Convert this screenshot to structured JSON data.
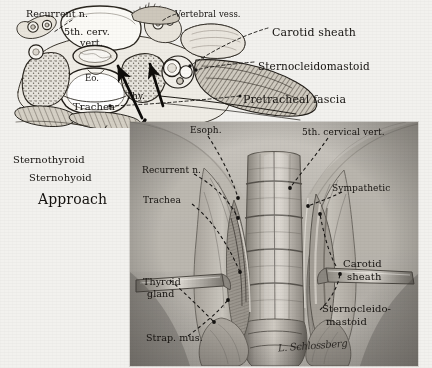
{
  "plate": {
    "kind": "anatomical-illustration-plate",
    "background_color": "#f2f1ee",
    "ink_color": "#15120f",
    "signature": "L. Schlossberg"
  },
  "top_diagram": {
    "name": "cross-section-of-neck-at-fifth-cervical-vertebra",
    "labels": [
      {
        "id": "recurrent-n",
        "text": "Recurrent n.",
        "x": 26,
        "y": 9,
        "size": 9.5,
        "style": "serif"
      },
      {
        "id": "fifth-cervical-vert",
        "text": "5th. cerv.",
        "x": 64,
        "y": 27,
        "size": 9.5,
        "style": "serif"
      },
      {
        "id": "fifth-cervical-vert-2",
        "text": "vert.",
        "x": 80,
        "y": 38,
        "size": 9.5,
        "style": "serif"
      },
      {
        "id": "vertebral-vess",
        "text": "Vertebral vess.",
        "x": 175,
        "y": 10,
        "size": 8.5,
        "style": "serif"
      },
      {
        "id": "carotid-sheath",
        "text": "Carotid sheath",
        "x": 272,
        "y": 27,
        "size": 11,
        "style": "serif"
      },
      {
        "id": "sternocleidomastoid",
        "text": "Sternocleidomastoid",
        "x": 258,
        "y": 61,
        "size": 10.5,
        "style": "serif"
      },
      {
        "id": "pretracheal-fascia",
        "text": "Pretracheal fascia",
        "x": 243,
        "y": 94,
        "size": 11,
        "style": "serif"
      },
      {
        "id": "esophagus-abbrev",
        "text": "Eo.",
        "x": 85,
        "y": 74,
        "size": 8.5,
        "style": "serif"
      },
      {
        "id": "thyroid-abbrev",
        "text": "Thy.",
        "x": 126,
        "y": 92,
        "size": 9,
        "style": "serif"
      },
      {
        "id": "trachea",
        "text": "Trachea",
        "x": 73,
        "y": 102,
        "size": 10,
        "style": "serif"
      },
      {
        "id": "sternothyroid",
        "text": "Sternothyroid",
        "x": 13,
        "y": 155,
        "size": 10,
        "style": "serif"
      },
      {
        "id": "sternohyoid",
        "text": "Sternohyoid",
        "x": 29,
        "y": 173,
        "size": 10,
        "style": "serif"
      },
      {
        "id": "approach",
        "text": "Approach",
        "x": 38,
        "y": 192,
        "size": 14,
        "style": "serif"
      }
    ]
  },
  "lower_panel": {
    "name": "surgical-exposure-of-anterior-cervical-spine",
    "labels": [
      {
        "id": "esoph",
        "text": "Esoph.",
        "x": 190,
        "y": 126,
        "size": 9,
        "style": "serif"
      },
      {
        "id": "fifth-cervical-vert",
        "text": "5th. cervical vert.",
        "x": 302,
        "y": 128,
        "size": 9,
        "style": "serif"
      },
      {
        "id": "recurrent-n",
        "text": "Recurrent n.",
        "x": 142,
        "y": 166,
        "size": 9,
        "style": "serif"
      },
      {
        "id": "sympathetic",
        "text": "Sympathetic",
        "x": 332,
        "y": 184,
        "size": 9,
        "style": "serif"
      },
      {
        "id": "trachea",
        "text": "Trachea",
        "x": 143,
        "y": 196,
        "size": 9,
        "style": "serif"
      },
      {
        "id": "carotid-sheath",
        "text": "Carotid",
        "x": 343,
        "y": 259,
        "size": 10,
        "style": "serif"
      },
      {
        "id": "carotid-sheath-2",
        "text": "sheath",
        "x": 347,
        "y": 272,
        "size": 10,
        "style": "serif"
      },
      {
        "id": "thyroid-gland",
        "text": "Thyroid",
        "x": 143,
        "y": 277,
        "size": 9.5,
        "style": "serif"
      },
      {
        "id": "thyroid-gland-2",
        "text": "gland",
        "x": 147,
        "y": 289,
        "size": 9.5,
        "style": "serif"
      },
      {
        "id": "sternocleidomastoid",
        "text": "Sternocleido-",
        "x": 322,
        "y": 304,
        "size": 10,
        "style": "serif"
      },
      {
        "id": "sternocleidomastoid-2",
        "text": "mastoid",
        "x": 326,
        "y": 317,
        "size": 10,
        "style": "serif"
      },
      {
        "id": "strap-mus",
        "text": "Strap. mus.",
        "x": 146,
        "y": 333,
        "size": 9.5,
        "style": "serif"
      }
    ]
  }
}
